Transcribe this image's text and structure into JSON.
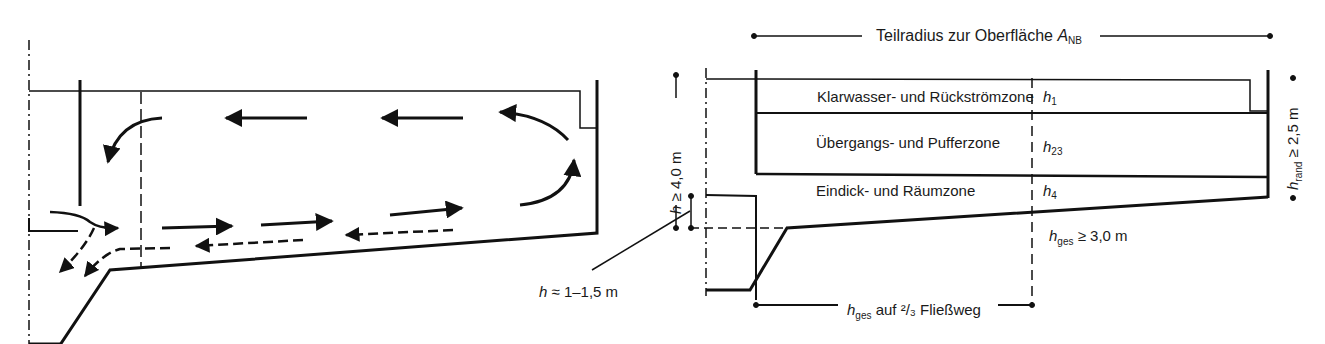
{
  "diagram": {
    "left_panel": {
      "description": "Flow circulation in sedimentation basin (section)",
      "label_h_approx": {
        "var": "h",
        "text": " ≈ 1–1,5 m"
      }
    },
    "right_panel": {
      "top_dimension": {
        "text": "Teilradius zur Oberfläche ",
        "var": "A",
        "sub": "NB"
      },
      "zones": [
        {
          "name": "Klarwasser- und Rückströmzone",
          "var": "h",
          "sub": "1"
        },
        {
          "name": "Übergangs- und Pufferzone",
          "var": "h",
          "sub": "23"
        },
        {
          "name": "Eindick- und Räumzone",
          "var": "h",
          "sub": "4"
        }
      ],
      "left_dimension": {
        "var": "h",
        "text": " ≥ 4,0 m"
      },
      "right_dimension": {
        "var": "h",
        "sub": "rand",
        "text": " ≥ 2,5 m"
      },
      "hges_label": {
        "var": "h",
        "sub": "ges",
        "text": " ≥ 3,0 m"
      },
      "bottom_dimension": {
        "var": "h",
        "sub": "ges",
        "text": " auf ²/₃ Fließweg"
      }
    },
    "colors": {
      "line": "#111111",
      "background": "#ffffff"
    }
  }
}
